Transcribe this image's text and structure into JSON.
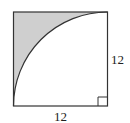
{
  "figure": {
    "side_label_right": "12",
    "side_label_bottom": "12",
    "shade_color": "#cfcfcf",
    "stroke_color": "#333333",
    "right_angle_marker": "bottom-right corner"
  }
}
